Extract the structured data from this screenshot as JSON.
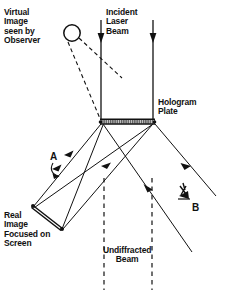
{
  "figure": {
    "labels": {
      "virtual_image": "Virtual\nImage\nseen by\nObserver",
      "incident_beam": "Incident\nLaser\nBeam",
      "hologram_plate": "Hologram\nPlate",
      "real_image": "Real\nImage\nFocused on\nScreen",
      "undiffracted_beam": "Undiffracted\nBeam",
      "point_a": "A",
      "point_b": "B"
    },
    "colors": {
      "ink": "#111111",
      "background": "#ffffff",
      "plate_fill": "#c9c9c9"
    },
    "elements": [
      {
        "name": "virtual-image-circle",
        "type": "circle",
        "cx": 72,
        "cy": 33,
        "r": 8
      },
      {
        "name": "incident-beam-left",
        "type": "arrow-line",
        "x1": 101,
        "y1": 20,
        "x2": 101,
        "y2": 121
      },
      {
        "name": "incident-beam-right",
        "type": "arrow-line",
        "x1": 153,
        "y1": 20,
        "x2": 153,
        "y2": 121
      },
      {
        "name": "hologram-plate-bar",
        "type": "hatched-bar",
        "x1": 100,
        "y1": 122,
        "x2": 155,
        "y2": 122
      },
      {
        "name": "screen-bar",
        "type": "double-line",
        "x1": 33,
        "y1": 206,
        "x2": 63,
        "y2": 229
      },
      {
        "name": "observer-eye",
        "type": "eye",
        "cx": 186,
        "cy": 190
      },
      {
        "name": "undiffracted-dash-left",
        "type": "dashed-line",
        "x": 104,
        "y1": 178,
        "y2": 289
      },
      {
        "name": "undiffracted-dash-right",
        "type": "dashed-line",
        "x": 152,
        "y1": 178,
        "y2": 289
      }
    ]
  }
}
